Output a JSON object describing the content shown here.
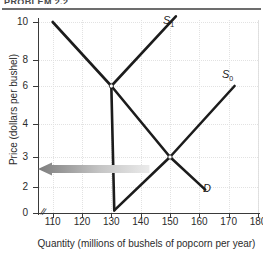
{
  "header": {
    "caption": "PROBLEM 2.2"
  },
  "chart_data": {
    "type": "line",
    "title": "",
    "xlabel": "Quantity (millions of bushels of popcorn per year)",
    "ylabel": "Price (dollars per bushel)",
    "xlim": [
      105,
      180
    ],
    "ylim": [
      0,
      10.6
    ],
    "xticks": [
      110,
      120,
      130,
      140,
      150,
      160,
      170,
      180
    ],
    "yticks": [
      0,
      2,
      3,
      4,
      6,
      8,
      10
    ],
    "grid": true,
    "axis_break": true,
    "legend": "inline-labels",
    "series": [
      {
        "name": "S1",
        "label": "S",
        "sublabel": "1",
        "type": "supply",
        "points": [
          [
            131,
            0.2
          ],
          [
            130,
            6
          ],
          [
            152,
            10.3
          ]
        ],
        "color": "#1c1c1c"
      },
      {
        "name": "S0",
        "label": "S",
        "sublabel": "0",
        "type": "supply",
        "points": [
          [
            131,
            0.2
          ],
          [
            150,
            3
          ],
          [
            172,
            6.0
          ]
        ],
        "color": "#1c1c1c"
      },
      {
        "name": "D",
        "label": "D",
        "sublabel": "",
        "type": "demand",
        "points": [
          [
            110,
            10.0
          ],
          [
            130,
            6
          ],
          [
            150,
            3
          ],
          [
            162,
            1.8
          ]
        ],
        "color": "#1c1c1c"
      }
    ],
    "equilibria": [
      {
        "name": "equilibrium-S1-D",
        "quantity": 130,
        "price": 6
      },
      {
        "name": "equilibrium-S0-D",
        "quantity": 150,
        "price": 3
      }
    ],
    "annotations": [
      {
        "name": "shift-arrow",
        "kind": "arrow",
        "direction": "left",
        "from_x": 143,
        "to_x": 105,
        "at_y": 2.6,
        "color_from": "#8c8c8c",
        "color_to": "#e8e8e8"
      }
    ]
  },
  "colors": {
    "curve": "#1c1c1c",
    "axis": "#3a3a3a",
    "grid": "#e2e2e2",
    "text": "#2b2b2b",
    "rule": "#6d6d6d",
    "arrow_dark": "#7d7d7d",
    "arrow_light": "#ebebeb"
  }
}
